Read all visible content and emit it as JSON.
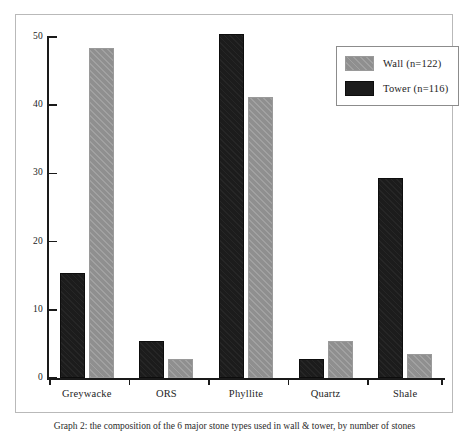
{
  "chart_data": {
    "type": "bar",
    "categories": [
      "Greywacke",
      "ORS",
      "Phyllite",
      "Quartz",
      "Shale"
    ],
    "series": [
      {
        "name": "Wall (n=122)",
        "key": "wall",
        "color": "#8f8f8f",
        "values": [
          48.4,
          2.8,
          41.2,
          5.5,
          3.5
        ]
      },
      {
        "name": "Tower (n=116)",
        "key": "tower",
        "color": "#1c1c1c",
        "values": [
          15.4,
          5.5,
          50.5,
          2.8,
          29.4
        ]
      }
    ],
    "series_draw_order": [
      "tower",
      "wall"
    ],
    "title": "",
    "subtitle": "",
    "xlabel": "",
    "ylabel": "",
    "ylim": [
      0,
      50
    ],
    "yticks": [
      0,
      10,
      20,
      30,
      40,
      50
    ],
    "ytick_labels": [
      "0",
      "10",
      "20",
      "30",
      "40",
      "50"
    ],
    "grid": false,
    "legend_position": "top-right",
    "annotations": []
  },
  "legend": {
    "entries": [
      {
        "label": "Wall (n=122)",
        "swatch": "wall"
      },
      {
        "label": "Tower (n=116)",
        "swatch": "tower"
      }
    ]
  },
  "caption": {
    "text": "Graph 2: the composition of the 6 major stone types used in wall & tower, by number of stones"
  },
  "colors": {
    "wall": "#8f8f8f",
    "tower": "#1c1c1c",
    "axis": "#1a1a1a",
    "frame": "#b9b9b9",
    "background": "#ffffff"
  }
}
